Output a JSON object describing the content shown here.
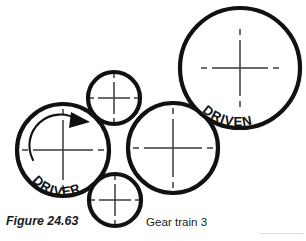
{
  "figure": {
    "caption_number": "Figure 24.63",
    "caption_title": "Gear train 3",
    "canvas": {
      "width": 306,
      "height": 241,
      "background": "#ffffff"
    }
  },
  "labels": {
    "driver": "DRIVER",
    "driven": "DRIVEN"
  },
  "colors": {
    "outline": "#111111",
    "centerline": "#3a3a3a",
    "background": "#ffffff",
    "rule": "#dcdcdc",
    "text": "#1a1a1a"
  },
  "gears": [
    {
      "name": "driver-gear",
      "label": "DRIVER",
      "role": "driver",
      "cx": 63,
      "cy": 150,
      "r": 46,
      "size": "large",
      "rotation_arrow": true,
      "rotation_direction": "clockwise"
    },
    {
      "name": "idler-gear-top",
      "label": "",
      "role": "idler",
      "cx": 114,
      "cy": 98,
      "r": 26,
      "size": "small",
      "rotation_arrow": false,
      "rotation_direction": ""
    },
    {
      "name": "idler-gear-bottom",
      "label": "",
      "role": "idler",
      "cx": 115,
      "cy": 200,
      "r": 26,
      "size": "small",
      "rotation_arrow": false,
      "rotation_direction": ""
    },
    {
      "name": "intermediate-gear",
      "label": "",
      "role": "intermediate",
      "cx": 173,
      "cy": 148,
      "r": 45,
      "size": "large",
      "rotation_arrow": false,
      "rotation_direction": ""
    },
    {
      "name": "driven-gear",
      "label": "DRIVEN",
      "role": "driven",
      "cx": 240,
      "cy": 68,
      "r": 60,
      "size": "largest",
      "rotation_arrow": false,
      "rotation_direction": ""
    }
  ],
  "annotations": {
    "rotation_arrow_name": "rotation-direction-arrow",
    "center_mark_name": "center-cross-mark"
  }
}
